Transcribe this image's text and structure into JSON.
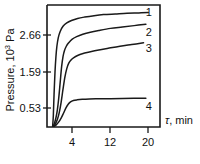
{
  "chart_data": {
    "type": "line",
    "title": "",
    "xlabel": "τ, min",
    "ylabel": "Pressure, 10³ Pa",
    "ylabel_text": "Pressure, 10",
    "ylabel_exponent": "3",
    "ylabel_unit": " Pa",
    "xlabel_symbol": "τ",
    "xlabel_rest": ", min",
    "xticks": [
      4,
      12,
      20
    ],
    "xtick_labels": [
      "4",
      "12",
      "20"
    ],
    "yticks": [
      0.53,
      1.59,
      2.66
    ],
    "ytick_labels": [
      "0.53",
      "1.59",
      "2.66"
    ],
    "xlim": [
      0,
      24
    ],
    "ylim": [
      0,
      3.55
    ],
    "grid": false,
    "legend": "inline-curve-numbers",
    "series": [
      {
        "name": "1",
        "label": "1",
        "label_x": 21.6,
        "label_y": 3.35,
        "x": [
          1.2,
          1.35,
          1.5,
          1.7,
          1.9,
          2.1,
          2.4,
          2.8,
          3.4,
          4.2,
          5.2,
          6.5,
          8.0,
          10.0,
          12.0,
          14.5,
          17.0,
          19.5,
          21.5
        ],
        "y": [
          0.02,
          0.35,
          0.95,
          1.6,
          2.05,
          2.35,
          2.6,
          2.78,
          2.93,
          3.03,
          3.1,
          3.16,
          3.2,
          3.24,
          3.27,
          3.29,
          3.31,
          3.32,
          3.33
        ]
      },
      {
        "name": "2",
        "label": "2",
        "label_x": 21.6,
        "label_y": 2.76,
        "x": [
          1.3,
          1.6,
          1.9,
          2.2,
          2.5,
          2.8,
          3.1,
          3.4,
          3.7,
          4.1,
          4.6,
          5.3,
          6.3,
          7.6,
          9.2,
          11.0,
          13.5,
          16.0,
          18.5,
          21.0
        ],
        "y": [
          0.02,
          0.12,
          0.27,
          0.5,
          0.85,
          1.3,
          1.75,
          2.05,
          2.22,
          2.35,
          2.45,
          2.55,
          2.63,
          2.7,
          2.76,
          2.81,
          2.87,
          2.91,
          2.95,
          2.99
        ]
      },
      {
        "name": "3",
        "label": "3",
        "label_x": 21.6,
        "label_y": 2.29,
        "x": [
          1.4,
          1.8,
          2.2,
          2.6,
          3.0,
          3.4,
          3.8,
          4.2,
          4.6,
          5.1,
          5.7,
          6.5,
          7.5,
          9.0,
          11.0,
          13.0,
          15.5,
          18.0,
          20.5
        ],
        "y": [
          0.02,
          0.1,
          0.22,
          0.42,
          0.72,
          1.1,
          1.45,
          1.7,
          1.85,
          1.95,
          2.02,
          2.08,
          2.13,
          2.18,
          2.24,
          2.29,
          2.35,
          2.4,
          2.45
        ]
      },
      {
        "name": "4",
        "label": "4",
        "label_x": 21.6,
        "label_y": 0.6,
        "x": [
          1.5,
          2.0,
          2.5,
          3.0,
          3.5,
          4.0,
          4.5,
          5.0,
          5.6,
          6.4,
          7.5,
          9.0,
          11.0,
          13.5,
          16.0,
          18.5,
          21.0
        ],
        "y": [
          0.02,
          0.07,
          0.15,
          0.26,
          0.4,
          0.55,
          0.66,
          0.73,
          0.77,
          0.79,
          0.805,
          0.815,
          0.82,
          0.825,
          0.83,
          0.833,
          0.835
        ]
      }
    ]
  },
  "colors": {
    "line": "#1a1a1a",
    "background": "#ffffff"
  }
}
